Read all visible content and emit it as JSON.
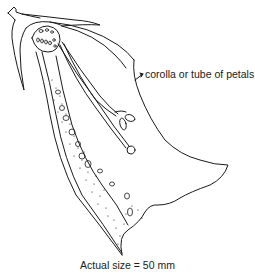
{
  "diagram": {
    "labels": {
      "corolla": "corolla or tube of petals",
      "scale": "Actual size = 50 mm"
    },
    "colors": {
      "line": "#1a1a1a",
      "background": "#ffffff"
    }
  }
}
